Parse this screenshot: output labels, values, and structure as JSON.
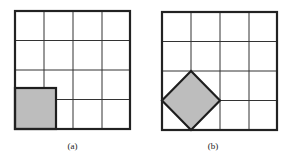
{
  "figure": {
    "panels": [
      {
        "id": "a",
        "caption": "(a)",
        "grid": {
          "rows": 4,
          "cols": 4
        },
        "shape": "axis-aligned square of side sqrt(2) at bottom-left corner"
      },
      {
        "id": "b",
        "caption": "(b)",
        "grid": {
          "rows": 4,
          "cols": 4
        },
        "shape": "square rotated 45 degrees with vertices at grid points"
      }
    ],
    "colors": {
      "grid_line": "#333333",
      "outer_border": "#222222",
      "shape_fill": "#bdbdbd",
      "shape_stroke": "#1e1e1e"
    }
  }
}
